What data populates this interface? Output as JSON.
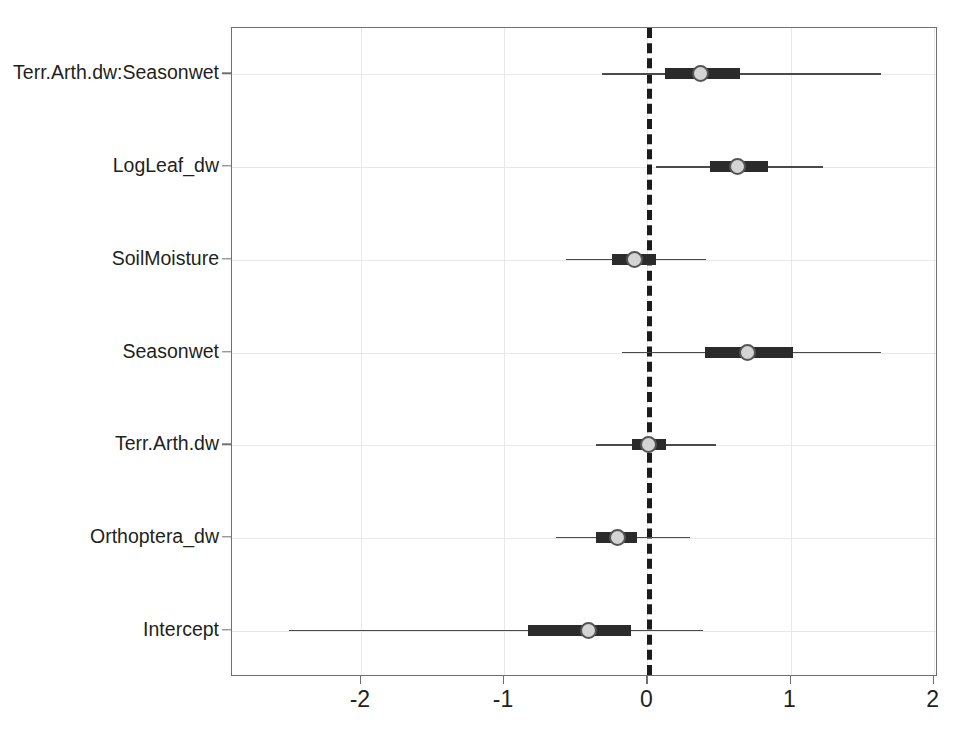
{
  "chart_data": {
    "type": "scatter",
    "plot_kind": "coefficient-forest-plot",
    "title": "",
    "subtitle": "",
    "xlabel": "",
    "ylabel": "",
    "xlim": [
      -2.9,
      2.03
    ],
    "ylim": [
      0.5,
      7.5
    ],
    "grid": true,
    "legend": null,
    "reference_line": {
      "x": 0,
      "style": "dashed",
      "color": "#1b1b1b",
      "width": 5
    },
    "xticks": [
      -2,
      -1,
      0,
      1,
      2
    ],
    "xticklabels": [
      "-2",
      "-1",
      "0",
      "1",
      "2"
    ],
    "categories": [
      "Terr.Arth.dw:Seasonwet",
      "LogLeaf_dw",
      "SoilMoisture",
      "Seasonwet",
      "Terr.Arth.dw",
      "Orthoptera_dw",
      "Intercept"
    ],
    "series": [
      {
        "name": "posterior estimate",
        "marker": "circle",
        "marker_fill": "#d4d4d4",
        "marker_edge": "#555555",
        "inner_interval_label": "50% CI",
        "outer_interval_label": "95% CI",
        "points": [
          {
            "term": "Terr.Arth.dw:Seasonwet",
            "estimate": 0.37,
            "inner_low": 0.12,
            "inner_high": 0.65,
            "outer_low": -0.32,
            "outer_high": 1.63
          },
          {
            "term": "LogLeaf_dw",
            "estimate": 0.63,
            "inner_low": 0.44,
            "inner_high": 0.84,
            "outer_low": 0.06,
            "outer_high": 1.23
          },
          {
            "term": "SoilMoisture",
            "estimate": -0.09,
            "inner_low": -0.25,
            "inner_high": 0.06,
            "outer_low": -0.57,
            "outer_high": 0.41
          },
          {
            "term": "Seasonwet",
            "estimate": 0.7,
            "inner_low": 0.4,
            "inner_high": 1.02,
            "outer_low": -0.18,
            "outer_high": 1.63
          },
          {
            "term": "Terr.Arth.dw",
            "estimate": 0.01,
            "inner_low": -0.11,
            "inner_high": 0.13,
            "outer_low": -0.36,
            "outer_high": 0.48
          },
          {
            "term": "Orthoptera_dw",
            "estimate": -0.21,
            "inner_low": -0.36,
            "inner_high": -0.07,
            "outer_low": -0.64,
            "outer_high": 0.3
          },
          {
            "term": "Intercept",
            "estimate": -0.41,
            "inner_low": -0.83,
            "inner_high": -0.11,
            "outer_low": -2.5,
            "outer_high": 0.39
          }
        ]
      }
    ]
  },
  "style": {
    "panel_border_color": "#6f6f6f",
    "grid_color": "#e8e8ea",
    "text_color": "#231f20",
    "interval_outer_color": "#4a4a4a",
    "interval_inner_color": "#2b2b2b",
    "background": "#ffffff"
  }
}
